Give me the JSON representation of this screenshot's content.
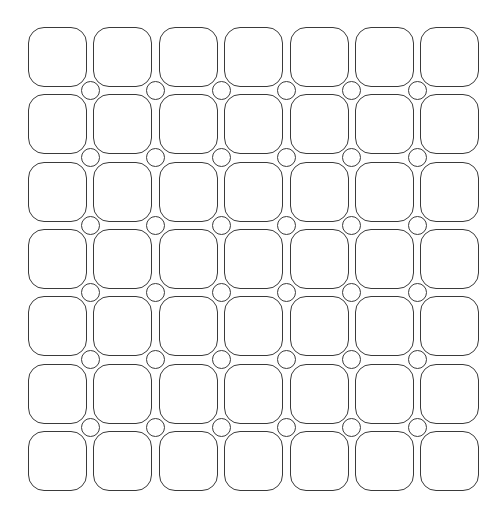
{
  "pattern": {
    "type": "rounded-square-grid-with-connector-circles",
    "rows": 7,
    "cols": 7,
    "origin_x": 28,
    "origin_y": 27,
    "col_pitch": 65.4,
    "row_pitch": 67.3,
    "tile_width": 59,
    "tile_height": 60,
    "tile_radius": 16,
    "circle_radius": 9.5,
    "circle_rows": 6,
    "circle_cols": 6,
    "stroke_color": "#3a3a3a",
    "fill_color": "#ffffff",
    "background_color": "#ffffff"
  }
}
